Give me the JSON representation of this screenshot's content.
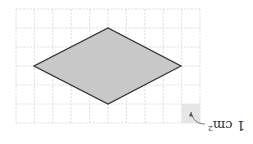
{
  "diagram": {
    "type": "rhombus-on-grid",
    "orientation": "rotated-180",
    "grid": {
      "columns": 10,
      "rows": 6,
      "cell_label": "1 cm²",
      "shaded_cell": "corner unit square"
    },
    "shape": {
      "name": "rhombus",
      "vertices_grid_units": [
        [
          1,
          2
        ],
        [
          5,
          0
        ],
        [
          9,
          2
        ],
        [
          5,
          4
        ]
      ],
      "fill": "#c8c8c8",
      "stroke": "#333333"
    },
    "legend": {
      "text": "1 cm",
      "superscript": "2"
    }
  }
}
